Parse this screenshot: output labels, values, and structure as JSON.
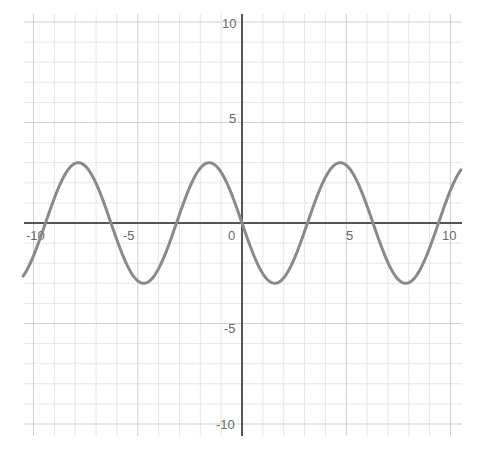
{
  "chart_data": {
    "type": "line",
    "title": "",
    "xlabel": "",
    "ylabel": "",
    "xlim": [
      -10.5,
      10.5
    ],
    "ylim": [
      -10.5,
      10.5
    ],
    "grid": true,
    "minor_grid_step": 1,
    "major_grid_step": 5,
    "x_ticks": [
      -10,
      -5,
      0,
      5,
      10
    ],
    "y_ticks": [
      10,
      5,
      -5,
      -10
    ],
    "tick_labels": {
      "x": [
        "-10",
        "-5",
        "0",
        "5",
        "10"
      ],
      "y": [
        "10",
        "5",
        "-5",
        "-10"
      ]
    },
    "series": [
      {
        "name": "y = -3 sin(x)",
        "amplitude": 3,
        "period": 6.283,
        "color": "#8a8a8a",
        "points": [
          {
            "x": -10.5,
            "y": -2.64
          },
          {
            "x": -9.42,
            "y": 0
          },
          {
            "x": -7.85,
            "y": 3
          },
          {
            "x": -6.28,
            "y": 0
          },
          {
            "x": -4.71,
            "y": -3
          },
          {
            "x": -3.14,
            "y": 0
          },
          {
            "x": -1.57,
            "y": 3
          },
          {
            "x": 0,
            "y": 0
          },
          {
            "x": 1.57,
            "y": -3
          },
          {
            "x": 3.14,
            "y": 0
          },
          {
            "x": 4.71,
            "y": 3
          },
          {
            "x": 6.28,
            "y": 0
          },
          {
            "x": 7.85,
            "y": -3
          },
          {
            "x": 9.42,
            "y": 0
          },
          {
            "x": 10.5,
            "y": 2.64
          }
        ]
      }
    ]
  },
  "colors": {
    "background": "#ffffff",
    "minor_grid": "#e6e6e6",
    "major_grid": "#cfcfcf",
    "axis": "#555555",
    "curve": "#8a8a8a",
    "label": "#6a6a6a"
  }
}
